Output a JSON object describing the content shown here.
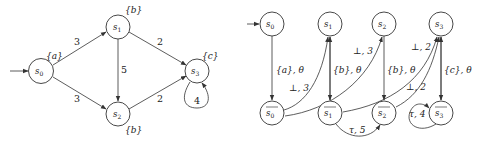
{
  "left_graph": {
    "nodes": [
      {
        "id": "s0",
        "label": "s0",
        "annotation": "{a}",
        "initial": true
      },
      {
        "id": "s1",
        "label": "s1",
        "annotation": "{b}"
      },
      {
        "id": "s2",
        "label": "s2",
        "annotation": "{b}"
      },
      {
        "id": "s3",
        "label": "s3",
        "annotation": "{c}"
      }
    ],
    "edges": [
      {
        "from": "s0",
        "to": "s1",
        "label": "3"
      },
      {
        "from": "s0",
        "to": "s2",
        "label": "3"
      },
      {
        "from": "s1",
        "to": "s2",
        "label": "5"
      },
      {
        "from": "s1",
        "to": "s3",
        "label": "2"
      },
      {
        "from": "s2",
        "to": "s3",
        "label": "2"
      },
      {
        "from": "s3",
        "to": "s3",
        "label": "4"
      }
    ]
  },
  "right_graph": {
    "nodes": [
      {
        "id": "s0",
        "label": "s0",
        "initial": true
      },
      {
        "id": "s1",
        "label": "s1"
      },
      {
        "id": "s2",
        "label": "s2"
      },
      {
        "id": "s3",
        "label": "s3"
      },
      {
        "id": "s0bar",
        "label": "s0",
        "overline": true
      },
      {
        "id": "s1bar",
        "label": "s1",
        "overline": true
      },
      {
        "id": "s2bar",
        "label": "s2",
        "overline": true
      },
      {
        "id": "s3bar",
        "label": "s3",
        "overline": true
      }
    ],
    "edges": [
      {
        "from": "s0",
        "to": "s0bar",
        "label": "{a}, θ"
      },
      {
        "from": "s0bar",
        "to": "s1",
        "label": "⊥, 3"
      },
      {
        "from": "s0bar",
        "to": "s2",
        "label": "⊥, 3"
      },
      {
        "from": "s1",
        "to": "s1bar",
        "label": "{b}, θ"
      },
      {
        "from": "s1bar",
        "to": "s3",
        "label": "⊥, 2"
      },
      {
        "from": "s1bar",
        "to": "s2bar",
        "label": "τ, 5"
      },
      {
        "from": "s2",
        "to": "s2bar",
        "label": "{b}, θ"
      },
      {
        "from": "s2bar",
        "to": "s3",
        "label": "⊥, 2"
      },
      {
        "from": "s3",
        "to": "s3bar",
        "label": "{c}, θ"
      },
      {
        "from": "s3bar",
        "to": "s3bar",
        "label": "τ, 4"
      }
    ]
  }
}
